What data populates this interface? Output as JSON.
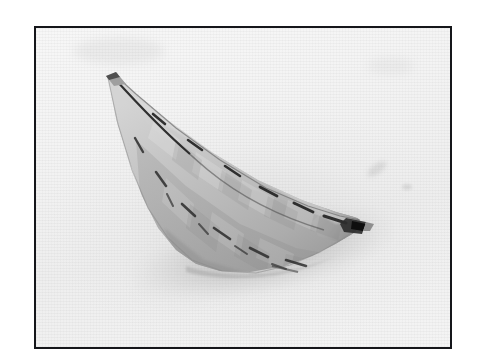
{
  "page": {
    "background_color": "#ffffff",
    "width": 481,
    "height": 363
  },
  "figure": {
    "name": "framed-photograph",
    "frame": {
      "border_color": "#15161a",
      "border_width_px": 2,
      "x": 34,
      "y": 26,
      "width": 418,
      "height": 323
    },
    "photo": {
      "background_color": "#f2f2f2",
      "description": "Black-and-white photograph of a long, slender boat-shaped object resting on a plain pale surface",
      "tone": "grayscale"
    },
    "subject": {
      "name": "model-boat",
      "description": "Elongated canoe / boat hull model with a faceted patchwork shell, tapering to a sharp upswept prow at the upper left and a blunt pointed stern at the lower right",
      "surface": "quilted panels with dark seam stitching along the gunwale",
      "body_color": "#bcbcbc",
      "shadow_color": "#8d8d8d",
      "highlight_color": "#dcdcdc",
      "seam_color": "#2a2a2a"
    }
  },
  "colors": {
    "frame": "#15161a",
    "paper": "#ffffff",
    "photo_bg": "#f2f2f2",
    "object_light": "#d2d2d2",
    "object_mid": "#bdbdbd",
    "object_dark": "#a2a2a2",
    "object_shade": "#8b8b8b",
    "seam": "#2b2b2b",
    "shadow": "#9a9a9a"
  }
}
